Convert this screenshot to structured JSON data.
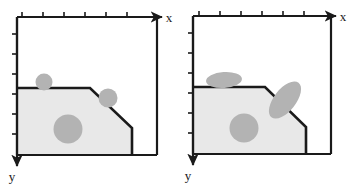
{
  "figure": {
    "type": "diagram",
    "background_color": "#ffffff",
    "panel_count": 2
  },
  "style": {
    "stroke_color": "#1a1a1a",
    "frame_stroke_width": 2.2,
    "boundary_stroke_width": 2.6,
    "region_fill": "#e8e8e8",
    "blob_fill": "#b3b3b3",
    "tick_color": "#1a1a1a",
    "tick_length": 4,
    "tick_width": 1.6
  },
  "panels": [
    {
      "id": "left",
      "name": "panel-left",
      "axes": {
        "x": {
          "label": "x",
          "direction": "right",
          "label_x": 169,
          "label_y": 22,
          "arrow_tip_x": 160,
          "arrow_y": 17,
          "tick_count": 6,
          "tick_positions": [
            22,
            43,
            64,
            85,
            106,
            127
          ]
        },
        "y": {
          "label": "y",
          "direction": "down",
          "label_x": 12,
          "label_y": 181,
          "arrow_tip_y": 163,
          "arrow_x": 17,
          "tick_count": 6,
          "tick_positions": [
            34,
            54,
            74,
            94,
            114,
            134
          ]
        }
      },
      "frame": {
        "left": 17,
        "top": 17,
        "right": 157,
        "bottom": 155
      },
      "region": {
        "name": "shaded-domain",
        "fill": "#e8e8e8",
        "points": "17,88 90,88 132,128 132,155 17,155"
      },
      "boundary_path": "M17,88 L90,88 L132,128 L132,155",
      "blobs": [
        {
          "name": "blob-small-top",
          "shape": "circle",
          "cx": 44,
          "cy": 82,
          "rx": 8.5,
          "ry": 8.5,
          "rotation": 0
        },
        {
          "name": "blob-edge-diagonal",
          "shape": "circle",
          "cx": 108,
          "cy": 98,
          "rx": 9.5,
          "ry": 9.5,
          "rotation": 0
        },
        {
          "name": "blob-large-interior",
          "shape": "circle",
          "cx": 68,
          "cy": 129,
          "rx": 14.5,
          "ry": 14.5,
          "rotation": 0
        }
      ]
    },
    {
      "id": "right",
      "name": "panel-right",
      "axes": {
        "x": {
          "label": "x",
          "direction": "right",
          "label_x": 163,
          "label_y": 21,
          "arrow_tip_x": 153,
          "arrow_y": 16,
          "tick_count": 6,
          "tick_positions": [
            19,
            40,
            61,
            82,
            103,
            124
          ]
        },
        "y": {
          "label": "y",
          "direction": "down",
          "label_x": 8,
          "label_y": 180,
          "arrow_tip_y": 162,
          "arrow_x": 13,
          "tick_count": 6,
          "tick_positions": [
            33,
            53,
            73,
            93,
            113,
            133
          ]
        }
      },
      "frame": {
        "left": 13,
        "top": 16,
        "right": 151,
        "bottom": 154
      },
      "region": {
        "name": "shaded-domain",
        "fill": "#e8e8e8",
        "points": "13,87 85,87 126,127 126,154 13,154"
      },
      "boundary_path": "M13,87 L85,87 L126,127 L126,154",
      "blobs": [
        {
          "name": "blob-flat-top",
          "shape": "ellipse",
          "cx": 44,
          "cy": 80,
          "rx": 18,
          "ry": 8,
          "rotation": -4
        },
        {
          "name": "blob-tilted-diagonal",
          "shape": "ellipse",
          "cx": 105,
          "cy": 100,
          "rx": 22,
          "ry": 11,
          "rotation": -52
        },
        {
          "name": "blob-large-interior",
          "shape": "ellipse",
          "cx": 64,
          "cy": 128,
          "rx": 14.5,
          "ry": 14.5,
          "rotation": 0
        }
      ]
    }
  ]
}
